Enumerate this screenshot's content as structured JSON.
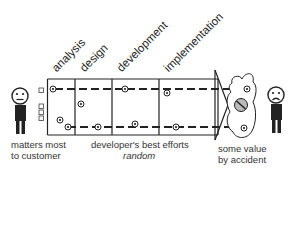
{
  "phases": [
    {
      "label": "analysis"
    },
    {
      "label": "design"
    },
    {
      "label": "development"
    },
    {
      "label": "implementation"
    }
  ],
  "customer": {
    "mood": "neutral",
    "caption_line1": "matters most",
    "caption_line2": "to customer"
  },
  "process": {
    "caption_line1": "developer's best efforts",
    "caption_line2": "random"
  },
  "outcome": {
    "mood": "sad",
    "caption_line1": "some value",
    "caption_line2": "by accident"
  },
  "colors": {
    "line": "#222222",
    "blob_fill": "#ffffff",
    "no_symbol_fill": "#bbbbbb"
  }
}
